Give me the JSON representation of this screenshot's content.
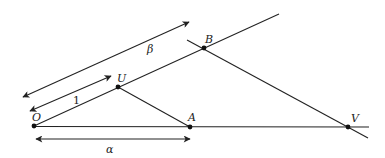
{
  "diagram": {
    "title": "",
    "points": [
      {
        "id": "O",
        "label": "O",
        "x": 34,
        "y": 126
      },
      {
        "id": "U",
        "label": "U",
        "x": 118,
        "y": 87
      },
      {
        "id": "A",
        "label": "A",
        "x": 190,
        "y": 127
      },
      {
        "id": "B",
        "label": "B",
        "x": 204,
        "y": 48
      },
      {
        "id": "V",
        "label": "V",
        "x": 348,
        "y": 127
      }
    ],
    "lines": [
      {
        "name": "ray-O-horizontal",
        "from": "O",
        "to": "V",
        "extends": true
      },
      {
        "name": "ray-O-through-U-B",
        "from": "O",
        "to": "B",
        "extends": true
      },
      {
        "name": "segment-U-A",
        "from": "U",
        "to": "A"
      },
      {
        "name": "line-B-V",
        "from": "B",
        "to": "V",
        "extends": true
      }
    ],
    "measures": [
      {
        "name": "alpha",
        "label": "α",
        "from": "O",
        "to": "A"
      },
      {
        "name": "beta",
        "label": "β",
        "from": "O",
        "to": "B"
      },
      {
        "name": "unit",
        "label": "1",
        "from": "O",
        "to": "U"
      }
    ],
    "colors": {
      "stroke": "#222222",
      "background": "#ffffff"
    }
  }
}
